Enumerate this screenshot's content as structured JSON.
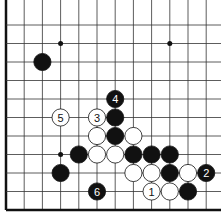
{
  "diagram": {
    "type": "go-board-fragment",
    "grid": {
      "origin_x": 6,
      "origin_y": 25,
      "spacing_x": 18.2,
      "spacing_y": 18.5,
      "cols": 12,
      "rows": 11,
      "left_edge": true,
      "bottom_edge": true
    },
    "star_points": [
      {
        "col": 3,
        "row": 1
      },
      {
        "col": 9,
        "row": 1
      },
      {
        "col": 3,
        "row": 7
      }
    ],
    "stones": [
      {
        "col": 2,
        "row": 2,
        "color": "black",
        "label": ""
      },
      {
        "col": 6,
        "row": 4,
        "color": "black",
        "label": "4"
      },
      {
        "col": 3,
        "row": 5,
        "color": "white",
        "label": "5"
      },
      {
        "col": 5,
        "row": 5,
        "color": "white",
        "label": "3"
      },
      {
        "col": 6,
        "row": 5,
        "color": "black",
        "label": ""
      },
      {
        "col": 5,
        "row": 6,
        "color": "white",
        "label": ""
      },
      {
        "col": 6,
        "row": 6,
        "color": "black",
        "label": ""
      },
      {
        "col": 7,
        "row": 6,
        "color": "white",
        "label": ""
      },
      {
        "col": 4,
        "row": 7,
        "color": "black",
        "label": ""
      },
      {
        "col": 5,
        "row": 7,
        "color": "white",
        "label": ""
      },
      {
        "col": 6,
        "row": 7,
        "color": "white",
        "label": ""
      },
      {
        "col": 7,
        "row": 7,
        "color": "black",
        "label": ""
      },
      {
        "col": 8,
        "row": 7,
        "color": "black",
        "label": ""
      },
      {
        "col": 9,
        "row": 7,
        "color": "black",
        "label": ""
      },
      {
        "col": 3,
        "row": 8,
        "color": "black",
        "label": ""
      },
      {
        "col": 7,
        "row": 8,
        "color": "white",
        "label": ""
      },
      {
        "col": 8,
        "row": 8,
        "color": "white",
        "label": ""
      },
      {
        "col": 9,
        "row": 8,
        "color": "black",
        "label": ""
      },
      {
        "col": 10,
        "row": 8,
        "color": "white",
        "label": ""
      },
      {
        "col": 11,
        "row": 8,
        "color": "black",
        "label": "2"
      },
      {
        "col": 5,
        "row": 9,
        "color": "black",
        "label": "6"
      },
      {
        "col": 8,
        "row": 9,
        "color": "white",
        "label": "1"
      },
      {
        "col": 9,
        "row": 9,
        "color": "white",
        "label": ""
      },
      {
        "col": 10,
        "row": 9,
        "color": "black",
        "label": ""
      }
    ],
    "colors": {
      "line": "#333333",
      "edge": "#111111",
      "black": "#111111",
      "white": "#ffffff"
    }
  }
}
